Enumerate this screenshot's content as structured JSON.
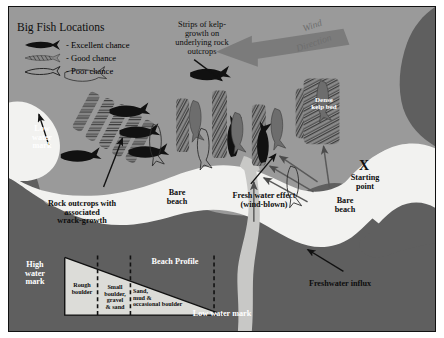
{
  "figure": {
    "type": "shore-fishing-map-diagram",
    "legend": {
      "title": "Big Fish Locations",
      "items": [
        {
          "icon": "solid-fish-icon",
          "label": "- Excellent chance"
        },
        {
          "icon": "hatched-fish-icon",
          "label": "- Good chance"
        },
        {
          "icon": "outline-fish-icon",
          "label": "- Poor chance"
        }
      ]
    },
    "annotations": {
      "kelp_strips": "Strips of kelp-\ngrowth on\nunderlying rock\noutcrops",
      "wind_word1": "Wind",
      "wind_word2": "Direction",
      "dense_kelp_bed": "Dense\nkelp bed",
      "low_water_mark_left": "Low\nwater\nmark",
      "rock_outcrops": "Rock outcrops with\nassociated\nwrack-growth",
      "bare_beach_left": "Bare\nbeach",
      "bare_beach_right": "Bare\nbeach",
      "fresh_water_effect": "Fresh water effect\n(wind-blown)",
      "starting_point_marker": "X",
      "starting_point_label": "Starting\npoint",
      "freshwater_influx": "Freshwater influx"
    },
    "profile": {
      "title": "Beach Profile",
      "high_water_mark": "High\nwater\nmark",
      "low_water_mark": "Low water mark",
      "zones": [
        "Rough\nboulder",
        "Small\nboulder,\ngravel\n& sand",
        "Sand,\nmud &\noccasional boulder"
      ]
    },
    "colors": {
      "sea": "#9a9a9a",
      "land": "#5f5f5f",
      "beach": "#f2f2f0",
      "kelp": "#6a6a6a",
      "arrow_dark": "#111111",
      "wind_arrow": "#7a7a7a",
      "stream": "#c8c8c6",
      "profile_fill": "#dcdcd8"
    }
  }
}
